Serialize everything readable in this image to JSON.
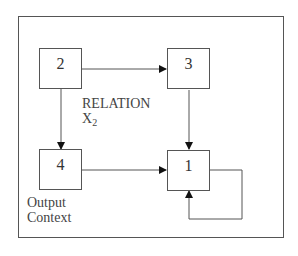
{
  "diagram": {
    "nodes": [
      {
        "id": "1",
        "label": "1"
      },
      {
        "id": "2",
        "label": "2"
      },
      {
        "id": "3",
        "label": "3"
      },
      {
        "id": "4",
        "label": "4"
      }
    ],
    "edges": [
      {
        "from": "2",
        "to": "3"
      },
      {
        "from": "2",
        "to": "4"
      },
      {
        "from": "3",
        "to": "1"
      },
      {
        "from": "4",
        "to": "1"
      },
      {
        "from": "1",
        "to": "1"
      }
    ],
    "relation_label": "RELATION",
    "relation_var": "X",
    "relation_sub": "2",
    "output_label_line1": "Output",
    "output_label_line2": "Context",
    "colors": {
      "line": "#555555",
      "text": "#333333",
      "background": "#ffffff"
    }
  }
}
